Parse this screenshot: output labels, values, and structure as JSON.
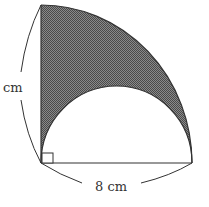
{
  "diagram": {
    "type": "geometry",
    "labels": {
      "left_dimension": "cm",
      "bottom_dimension": "8 cm"
    },
    "shapes": {
      "quarter_circle": {
        "center": "right-angle corner",
        "radius_label": "8 cm"
      },
      "semicircle": {
        "diameter_label": "8 cm"
      },
      "right_angle_marker": true,
      "shaded_region": "between quarter arc, vertical radius and semicircle"
    },
    "colors": {
      "stroke": "#333333",
      "shade": "#6e6e6e",
      "background": "#ffffff"
    }
  }
}
